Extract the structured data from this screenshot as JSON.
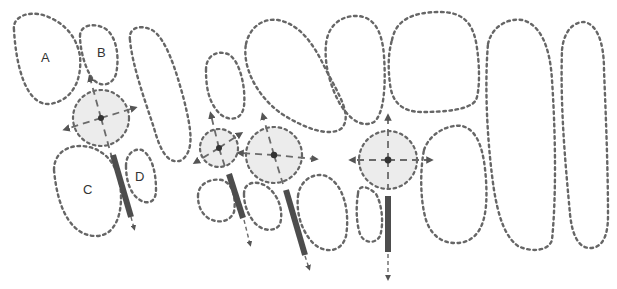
{
  "diagram": {
    "labels": [
      {
        "id": "A",
        "text": "A",
        "x": 46,
        "y": 62
      },
      {
        "id": "B",
        "text": "B",
        "x": 102,
        "y": 57
      },
      {
        "id": "C",
        "text": "C",
        "x": 88,
        "y": 194
      },
      {
        "id": "D",
        "text": "D",
        "x": 140,
        "y": 181
      }
    ],
    "colors": {
      "outline": "#666666",
      "disk_fill": "#ececec",
      "bar": "#4d4d4d",
      "arrow": "#555555"
    },
    "stages": [
      {
        "name": "stage-1",
        "disk": {
          "cx": 101,
          "cy": 118,
          "r": 28
        }
      },
      {
        "name": "stage-2",
        "disk": {
          "cx": 219,
          "cy": 148,
          "r": 19
        }
      },
      {
        "name": "stage-3",
        "disk": {
          "cx": 274,
          "cy": 155,
          "r": 28
        }
      },
      {
        "name": "stage-4",
        "disk": {
          "cx": 388,
          "cy": 160,
          "r": 29
        }
      }
    ]
  }
}
